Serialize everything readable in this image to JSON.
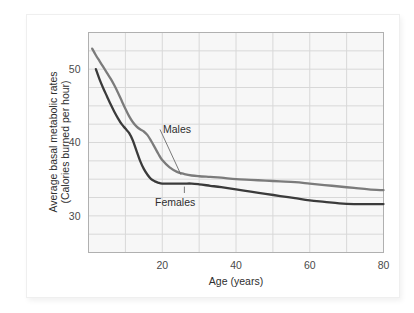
{
  "figure": {
    "background_color": "#ffffff",
    "plot_background_color": "#f7f7f7",
    "grid_color": "#d8d8d8",
    "frame_color": "#b0b0b0"
  },
  "chart_data": {
    "type": "line",
    "title": "",
    "xlabel": "Age (years)",
    "ylabel": "Average basal metabolic rates (Calories burned per hour)",
    "ylabel_line1": "Average basal metabolic rates",
    "ylabel_line2": "(Calories burned per hour)",
    "xlim": [
      0,
      80
    ],
    "ylim": [
      25,
      55
    ],
    "xticks": [
      20,
      40,
      60,
      80
    ],
    "xtick_labels": [
      "20",
      "40",
      "60",
      "80"
    ],
    "yticks": [
      30,
      40,
      50
    ],
    "ytick_labels": [
      "30",
      "40",
      "50"
    ],
    "x_gridlines": [
      0,
      10,
      20,
      30,
      40,
      50,
      60,
      70,
      80
    ],
    "y_gridlines": [
      25,
      27.5,
      30,
      32.5,
      35,
      37.5,
      40,
      42.5,
      45,
      47.5,
      50,
      52.5,
      55
    ],
    "grid": true,
    "legend_position": "inline-annotations",
    "series": [
      {
        "name": "Males",
        "color": "#7b7b7b",
        "annotation_label": "Males",
        "x": [
          1,
          2,
          3,
          4,
          5,
          6,
          7,
          8,
          9,
          10,
          11,
          12,
          13,
          14,
          15,
          16,
          17,
          18,
          19,
          20,
          22,
          24,
          26,
          28,
          30,
          33,
          36,
          40,
          44,
          48,
          52,
          56,
          60,
          64,
          68,
          72,
          76,
          80
        ],
        "values": [
          52.8,
          51.9,
          51.1,
          50.3,
          49.5,
          48.7,
          47.8,
          46.8,
          45.7,
          44.6,
          43.6,
          42.8,
          42.2,
          41.8,
          41.5,
          41.0,
          40.2,
          39.3,
          38.4,
          37.6,
          36.6,
          36.0,
          35.7,
          35.5,
          35.4,
          35.3,
          35.2,
          35.0,
          34.9,
          34.8,
          34.7,
          34.6,
          34.4,
          34.2,
          34.0,
          33.8,
          33.6,
          33.5
        ]
      },
      {
        "name": "Females",
        "color": "#3b3b3b",
        "annotation_label": "Females",
        "x": [
          2,
          3,
          4,
          5,
          6,
          7,
          8,
          9,
          10,
          11,
          12,
          13,
          14,
          15,
          16,
          17,
          18,
          19,
          20,
          22,
          24,
          26,
          28,
          30,
          33,
          36,
          40,
          44,
          48,
          52,
          56,
          60,
          64,
          68,
          72,
          76,
          80
        ],
        "values": [
          50.0,
          48.6,
          47.4,
          46.3,
          45.2,
          44.2,
          43.3,
          42.5,
          41.9,
          41.3,
          40.3,
          38.9,
          37.5,
          36.4,
          35.6,
          35.0,
          34.7,
          34.5,
          34.4,
          34.4,
          34.4,
          34.4,
          34.4,
          34.3,
          34.1,
          33.9,
          33.6,
          33.3,
          33.0,
          32.7,
          32.4,
          32.1,
          31.9,
          31.7,
          31.6,
          31.6,
          31.6
        ]
      }
    ],
    "annotations": [
      {
        "label": "Males",
        "leader": "horizontal"
      },
      {
        "label": "Females",
        "leader": "vertical"
      }
    ]
  }
}
